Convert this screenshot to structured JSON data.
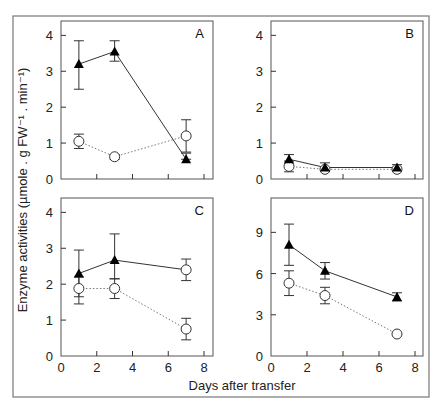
{
  "figure": {
    "ylabel": "Enzyme activities (µmole . g FW⁻¹ . min⁻¹)",
    "xlabel": "Days after transfer",
    "colors": {
      "frame": "#555555",
      "marker_filled": "#000000",
      "marker_open": "#ffffff",
      "solid_line": "#333333",
      "dotted_line": "#777777"
    }
  },
  "chart_data": [
    {
      "type": "line",
      "panel": "A",
      "x": [
        1,
        3,
        7
      ],
      "xlim": [
        0,
        8
      ],
      "xticks": [
        0,
        2,
        4,
        6,
        8
      ],
      "show_xticklabels": false,
      "ylim": [
        0,
        4.4
      ],
      "yticks": [
        0,
        1,
        2,
        3,
        4
      ],
      "series": [
        {
          "name": "filled-triangle",
          "marker": "triangle",
          "line": "solid",
          "values": [
            3.2,
            3.55,
            0.55
          ],
          "err_low": [
            2.5,
            3.28,
            0.55
          ],
          "err_high": [
            3.85,
            3.85,
            0.72
          ]
        },
        {
          "name": "open-circle",
          "marker": "circle",
          "line": "dotted",
          "values": [
            1.05,
            0.62,
            1.2
          ],
          "err_low": [
            0.85,
            0.55,
            0.75
          ],
          "err_high": [
            1.25,
            0.68,
            1.65
          ]
        }
      ]
    },
    {
      "type": "line",
      "panel": "B",
      "x": [
        1,
        3,
        7
      ],
      "xlim": [
        0,
        8
      ],
      "xticks": [
        0,
        2,
        4,
        6,
        8
      ],
      "show_xticklabels": false,
      "ylim": [
        0,
        4.4
      ],
      "yticks": [
        0,
        1,
        2,
        3,
        4
      ],
      "series": [
        {
          "name": "filled-triangle",
          "marker": "triangle",
          "line": "solid",
          "values": [
            0.55,
            0.32,
            0.32
          ],
          "err_low": [
            0.42,
            0.22,
            0.25
          ],
          "err_high": [
            0.68,
            0.45,
            0.4
          ]
        },
        {
          "name": "open-circle",
          "marker": "circle",
          "line": "dotted",
          "values": [
            0.35,
            0.27,
            0.27
          ],
          "err_low": [
            0.2,
            0.22,
            0.22
          ],
          "err_high": [
            0.5,
            0.32,
            0.32
          ]
        }
      ]
    },
    {
      "type": "line",
      "panel": "C",
      "x": [
        1,
        3,
        7
      ],
      "xlim": [
        0,
        8
      ],
      "xticks": [
        0,
        2,
        4,
        6,
        8
      ],
      "show_xticklabels": true,
      "ylim": [
        0,
        4.4
      ],
      "yticks": [
        0,
        1,
        2,
        3,
        4
      ],
      "series": [
        {
          "name": "filled-triangle",
          "marker": "triangle",
          "line": "solid",
          "values": [
            2.3,
            2.67,
            2.4
          ],
          "err_low": [
            1.65,
            2.15,
            2.1
          ],
          "err_high": [
            2.95,
            3.4,
            2.7
          ],
          "marker_overrides": {
            "2": "circle"
          }
        },
        {
          "name": "open-circle",
          "marker": "circle",
          "line": "dotted",
          "values": [
            1.88,
            1.88,
            0.75
          ],
          "err_low": [
            1.45,
            1.6,
            0.45
          ],
          "err_high": [
            2.2,
            2.15,
            1.05
          ]
        }
      ]
    },
    {
      "type": "line",
      "panel": "D",
      "x": [
        1,
        3,
        7
      ],
      "xlim": [
        0,
        8
      ],
      "xticks": [
        0,
        2,
        4,
        6,
        8
      ],
      "show_xticklabels": true,
      "ylim": [
        0,
        11.5
      ],
      "yticks": [
        0,
        3,
        6,
        9
      ],
      "series": [
        {
          "name": "filled-triangle",
          "marker": "triangle",
          "line": "solid",
          "values": [
            8.1,
            6.2,
            4.3
          ],
          "err_low": [
            6.6,
            5.6,
            4.0
          ],
          "err_high": [
            9.6,
            6.8,
            4.6
          ]
        },
        {
          "name": "open-circle",
          "marker": "circle",
          "line": "dotted",
          "values": [
            5.3,
            4.4,
            1.6
          ],
          "err_low": [
            4.4,
            3.8,
            1.6
          ],
          "err_high": [
            6.2,
            5.0,
            1.6
          ]
        }
      ]
    }
  ]
}
